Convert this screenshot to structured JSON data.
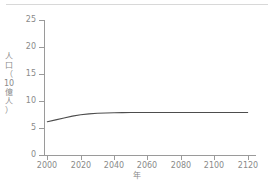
{
  "chart_data": {
    "type": "line",
    "title": "",
    "subtitle": "",
    "xlabel": "年",
    "ylabel": "人口（10億人）",
    "ylabel_chars": [
      "人",
      "口",
      "（",
      "10",
      "億",
      "人",
      "）"
    ],
    "xlim": [
      1998,
      2125
    ],
    "ylim": [
      0,
      25
    ],
    "xticks": [
      2000,
      2020,
      2040,
      2060,
      2080,
      2100,
      2120
    ],
    "xtick_labels": [
      "2000",
      "2020",
      "2040",
      "2060",
      "2080",
      "2100",
      "2120"
    ],
    "yticks": [
      0,
      5,
      10,
      15,
      20,
      25
    ],
    "ytick_labels": [
      "0",
      "5",
      "10",
      "15",
      "20",
      "25"
    ],
    "grid": false,
    "legend": "none",
    "spines": [
      "left",
      "bottom"
    ],
    "series": [
      {
        "name": "人口",
        "color": "#4d4d4d",
        "x": [
          2000,
          2005,
          2010,
          2015,
          2020,
          2025,
          2030,
          2035,
          2040,
          2045,
          2050,
          2060,
          2070,
          2080,
          2090,
          2100,
          2110,
          2120
        ],
        "values": [
          6.15,
          6.5,
          6.85,
          7.2,
          7.45,
          7.62,
          7.72,
          7.78,
          7.82,
          7.84,
          7.86,
          7.87,
          7.88,
          7.88,
          7.88,
          7.88,
          7.88,
          7.88
        ]
      }
    ]
  },
  "axis_colors": {
    "spine": "#9a9a9a",
    "tick_label": "#8a8a8a",
    "line": "#4d4d4d",
    "background": "#ffffff"
  }
}
